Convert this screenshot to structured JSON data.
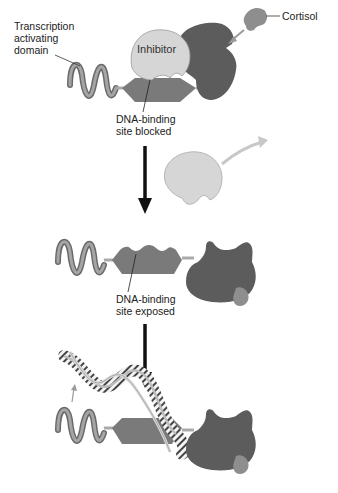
{
  "diagram": {
    "colors": {
      "receptor_dark": "#5c5c5c",
      "dna_binding_domain": "#7a7a7a",
      "inhibitor": "#d6d6d6",
      "cortisol": "#8e8e8e",
      "activating_domain": "#888888",
      "arrow": "#111111",
      "exit_arrow": "#c8c8c8"
    },
    "stages": [
      {
        "id": "stage-1",
        "labels": {
          "activating_domain": "Transcription\nactivating\ndomain",
          "inhibitor": "Inhibitor",
          "cortisol": "Cortisol",
          "binding_site": "DNA-binding\nsite blocked"
        }
      },
      {
        "id": "stage-2",
        "labels": {
          "binding_site": "DNA-binding\nsite exposed"
        }
      },
      {
        "id": "stage-3",
        "labels": {}
      }
    ],
    "edges": [
      {
        "from": "stage-1",
        "to": "stage-2",
        "type": "down-arrow"
      },
      {
        "from": "stage-2",
        "to": "stage-3",
        "type": "down-arrow"
      }
    ]
  }
}
